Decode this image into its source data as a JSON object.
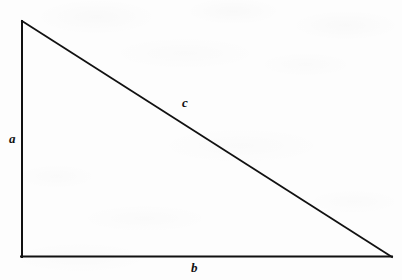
{
  "figure": {
    "name": "right-triangle-diagram",
    "background_color": "#fdfdfd",
    "stroke_color": "#111111",
    "stroke_width": 2,
    "width": 402,
    "height": 280
  },
  "geometry": {
    "vertices": {
      "top_left": {
        "x": 22,
        "y": 21
      },
      "bottom_left": {
        "x": 22,
        "y": 257
      },
      "bottom_right": {
        "x": 392,
        "y": 257
      }
    },
    "right_angle_vertex": "bottom_left",
    "polygon_points": "22,21 22,257 392,257"
  },
  "labels": {
    "a": {
      "text": "a",
      "side": "vertical-leg"
    },
    "b": {
      "text": "b",
      "side": "horizontal-leg"
    },
    "c": {
      "text": "c",
      "side": "hypotenuse"
    }
  }
}
